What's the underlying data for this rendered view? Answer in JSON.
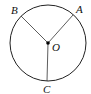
{
  "diagram": {
    "type": "circle-with-radii",
    "circle": {
      "cx": 48,
      "cy": 43,
      "r": 38,
      "stroke": "#222222"
    },
    "center": {
      "label": "O",
      "x": 48,
      "y": 43,
      "label_x": 52,
      "label_y": 51
    },
    "points": [
      {
        "label": "A",
        "x": 73,
        "y": 15,
        "label_x": 76,
        "label_y": 13
      },
      {
        "label": "B",
        "x": 21,
        "y": 16,
        "label_x": 11,
        "label_y": 14
      },
      {
        "label": "C",
        "x": 47,
        "y": 81,
        "label_x": 43,
        "label_y": 93
      }
    ],
    "segments": [
      {
        "from": "O",
        "to": "A"
      },
      {
        "from": "O",
        "to": "B"
      },
      {
        "from": "O",
        "to": "C"
      }
    ]
  }
}
